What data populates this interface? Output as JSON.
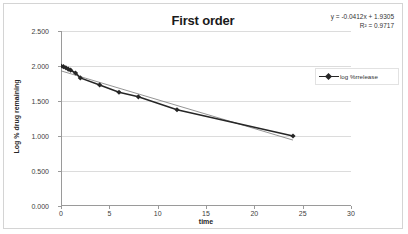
{
  "chart_data": {
    "type": "line",
    "title": "First order",
    "xlabel": "time",
    "ylabel": "Log % drug remaining",
    "xlim": [
      0,
      30
    ],
    "ylim": [
      0,
      2.5
    ],
    "xticks": [
      "0",
      "5",
      "10",
      "15",
      "20",
      "25",
      "30"
    ],
    "yticks": [
      "0.000",
      "0.500",
      "1.000",
      "1.500",
      "2.000",
      "2.500"
    ],
    "grid": "horizontal",
    "legend_position": "right",
    "series": [
      {
        "name": "log %rrelease",
        "marker": "diamond",
        "color": "#262626",
        "x": [
          0,
          0.25,
          0.5,
          0.75,
          1,
          1.5,
          2,
          4,
          6,
          8,
          12,
          24
        ],
        "values": [
          2.0,
          1.99,
          1.975,
          1.955,
          1.94,
          1.9,
          1.83,
          1.73,
          1.625,
          1.56,
          1.375,
          1.0
        ]
      }
    ],
    "trendline": {
      "name": "linear-trendline",
      "color": "#7a7a7a",
      "equation": "y = -0.0412x + 1.9305",
      "r_squared": "R² = 0.9717",
      "slope": -0.0412,
      "intercept": 1.9305,
      "x_start": 0,
      "x_end": 24
    },
    "annotations": [
      "y = -0.0412x + 1.9305",
      "R² = 0.9717"
    ]
  },
  "legend": {
    "entries": [
      {
        "label": "log %rrelease"
      }
    ]
  },
  "equation": {
    "line1": "y = -0.0412x + 1.9305",
    "line2": "R² = 0.9717"
  }
}
